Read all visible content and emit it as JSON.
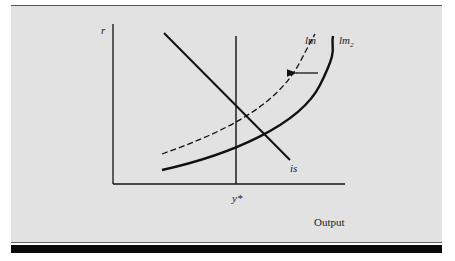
{
  "diagram": {
    "type": "IS-LM shift diagram",
    "y_axis_label": "r",
    "x_axis_label": "Output",
    "x_marker_label": "y*",
    "curves": [
      {
        "id": "is",
        "label": "is",
        "style": "solid"
      },
      {
        "id": "lm",
        "label": "lm",
        "style": "dashed"
      },
      {
        "id": "lm2",
        "label": "lm",
        "subscript": "2",
        "style": "solid-thick"
      }
    ],
    "annotations": [
      {
        "type": "arrow",
        "direction": "left",
        "from": "lm2",
        "to": "lm"
      }
    ],
    "colors": {
      "panel_background": "#e2e2e2",
      "ink": "#111111",
      "bottom_bar": "#0a0a0a"
    }
  }
}
